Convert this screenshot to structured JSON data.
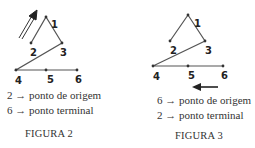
{
  "figures": [
    {
      "caption": "FIGURA 2",
      "lines": [
        {
          "node": "2",
          "arrow": "→",
          "text": "ponto de origem"
        },
        {
          "node": "6",
          "arrow": "→",
          "text": "ponto terminal"
        }
      ],
      "nodes": [
        {
          "id": "1",
          "x": 46,
          "y": 17
        },
        {
          "id": "2",
          "x": 31,
          "y": 43
        },
        {
          "id": "3",
          "x": 62,
          "y": 43
        },
        {
          "id": "4",
          "x": 16,
          "y": 70
        },
        {
          "id": "5",
          "x": 46,
          "y": 70
        },
        {
          "id": "6",
          "x": 77,
          "y": 70
        }
      ],
      "direction_arrow": "up-right"
    },
    {
      "caption": "FIGURA 3",
      "lines": [
        {
          "node": "6",
          "arrow": "→",
          "text": "ponto de origem"
        },
        {
          "node": "2",
          "arrow": "→",
          "text": "ponto terminal"
        }
      ],
      "nodes": [
        {
          "id": "1",
          "x": 188,
          "y": 15
        },
        {
          "id": "2",
          "x": 170,
          "y": 41
        },
        {
          "id": "3",
          "x": 205,
          "y": 41
        },
        {
          "id": "4",
          "x": 153,
          "y": 66
        },
        {
          "id": "5",
          "x": 188,
          "y": 66
        },
        {
          "id": "6",
          "x": 223,
          "y": 66
        }
      ],
      "direction_arrow": "left"
    }
  ]
}
